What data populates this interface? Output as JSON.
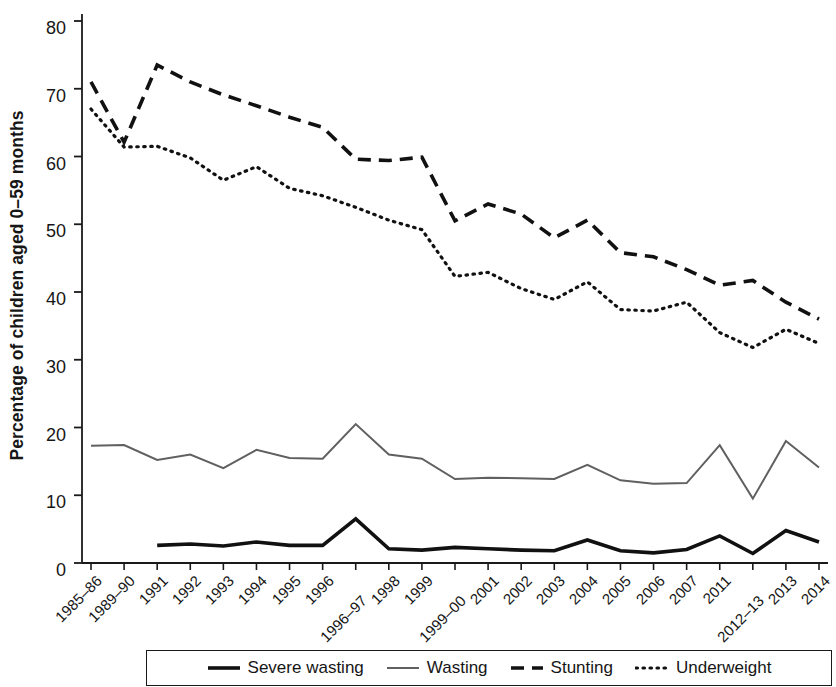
{
  "chart_data": {
    "type": "line",
    "title": "",
    "xlabel": "",
    "ylabel": "Percentage of children aged 0–59 months",
    "ylim": [
      0,
      80
    ],
    "yticks": [
      0,
      10,
      20,
      30,
      40,
      50,
      60,
      70,
      80
    ],
    "grid": false,
    "legend_position": "bottom",
    "categories": [
      "1985–86",
      "1989–90",
      "1991",
      "1992",
      "1993",
      "1994",
      "1995",
      "1996",
      "1996–97",
      "1998",
      "1999",
      "1999–00",
      "2001",
      "2002",
      "2003",
      "2004",
      "2005",
      "2006",
      "2007",
      "2011",
      "2012–13",
      "2013",
      "2014"
    ],
    "series": [
      {
        "name": "Severe wasting",
        "style": "solid-thick",
        "color": "#111111",
        "values": [
          null,
          null,
          2.6,
          2.8,
          2.5,
          3.1,
          2.6,
          2.6,
          6.5,
          2.1,
          1.9,
          2.3,
          2.1,
          1.9,
          1.8,
          3.4,
          1.8,
          1.5,
          2.0,
          4.0,
          1.4,
          4.8,
          3.1
        ]
      },
      {
        "name": "Wasting",
        "style": "solid-thin",
        "color": "#606060",
        "values": [
          17.3,
          17.4,
          15.2,
          16.0,
          14.0,
          16.7,
          15.5,
          15.4,
          20.5,
          16.0,
          15.4,
          12.4,
          12.6,
          12.5,
          12.4,
          14.5,
          12.2,
          11.7,
          11.8,
          17.4,
          9.5,
          18.0,
          14.1
        ]
      },
      {
        "name": "Stunting",
        "style": "dashed",
        "color": "#111111",
        "values": [
          71.0,
          62.1,
          73.5,
          71.0,
          69.1,
          67.5,
          65.8,
          64.3,
          59.6,
          59.4,
          59.9,
          50.5,
          53.0,
          51.5,
          48.0,
          50.6,
          45.8,
          45.2,
          43.3,
          41.0,
          41.7,
          38.5,
          36.0
        ]
      },
      {
        "name": "Underweight",
        "style": "dotted",
        "color": "#111111",
        "values": [
          67.0,
          61.4,
          61.5,
          59.8,
          56.5,
          58.5,
          55.3,
          54.2,
          52.5,
          50.6,
          49.2,
          42.3,
          42.9,
          40.5,
          38.9,
          41.5,
          37.4,
          37.2,
          38.5,
          34.0,
          31.8,
          34.5,
          32.4
        ]
      }
    ]
  },
  "legend": {
    "entries": [
      {
        "label": "Severe wasting",
        "style": "solid-thick"
      },
      {
        "label": "Wasting",
        "style": "solid-thin"
      },
      {
        "label": "Stunting",
        "style": "dashed"
      },
      {
        "label": "Underweight",
        "style": "dotted"
      }
    ]
  },
  "colors": {
    "severe_wasting": "#111111",
    "wasting": "#606060",
    "stunting": "#111111",
    "underweight": "#111111",
    "axis": "#1a1a1a",
    "background": "#ffffff"
  }
}
